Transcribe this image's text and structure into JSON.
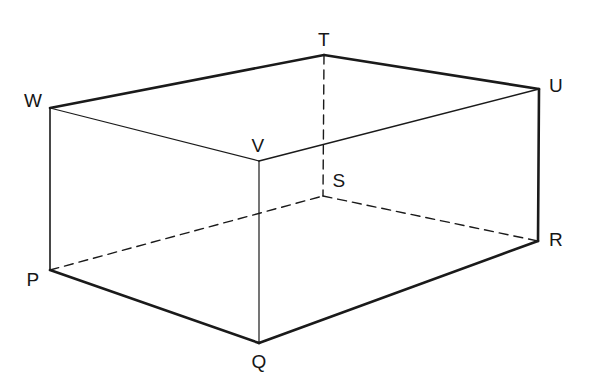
{
  "figure": {
    "type": "3d-cuboid-line-diagram",
    "background_color": "#ffffff",
    "line_color": "#1a1a1a",
    "canvas": {
      "width": 592,
      "height": 378
    }
  },
  "vertices": [
    {
      "id": "P",
      "label": "P",
      "x": 50,
      "y": 270,
      "label_x": 33,
      "label_y": 279,
      "hidden": false
    },
    {
      "id": "Q",
      "label": "Q",
      "x": 259,
      "y": 343,
      "label_x": 259,
      "label_y": 361,
      "hidden": false
    },
    {
      "id": "R",
      "label": "R",
      "x": 538,
      "y": 241,
      "label_x": 556,
      "label_y": 239,
      "hidden": false
    },
    {
      "id": "S",
      "label": "S",
      "x": 323,
      "y": 196,
      "label_x": 339,
      "label_y": 180,
      "hidden": true
    },
    {
      "id": "T",
      "label": "T",
      "x": 324,
      "y": 55,
      "label_x": 324,
      "label_y": 39,
      "hidden": false
    },
    {
      "id": "U",
      "label": "U",
      "x": 539,
      "y": 89,
      "label_x": 556,
      "label_y": 85,
      "hidden": false
    },
    {
      "id": "V",
      "label": "V",
      "x": 259,
      "y": 161,
      "label_x": 258,
      "label_y": 145,
      "hidden": false
    },
    {
      "id": "W",
      "label": "W",
      "x": 50,
      "y": 108,
      "label_x": 33,
      "label_y": 100,
      "hidden": false
    }
  ],
  "edges": [
    {
      "name": "edge-W-T",
      "from": "W",
      "to": "T",
      "style": "solid",
      "weight": 2.6
    },
    {
      "name": "edge-T-U",
      "from": "T",
      "to": "U",
      "style": "solid",
      "weight": 2.6
    },
    {
      "name": "edge-W-V",
      "from": "W",
      "to": "V",
      "style": "solid",
      "weight": 1.2
    },
    {
      "name": "edge-V-U",
      "from": "V",
      "to": "U",
      "style": "solid",
      "weight": 1.6
    },
    {
      "name": "edge-W-P",
      "from": "W",
      "to": "P",
      "style": "solid",
      "weight": 1.6
    },
    {
      "name": "edge-U-R",
      "from": "U",
      "to": "R",
      "style": "solid",
      "weight": 2.6
    },
    {
      "name": "edge-V-Q",
      "from": "V",
      "to": "Q",
      "style": "solid",
      "weight": 1.2
    },
    {
      "name": "edge-P-Q",
      "from": "P",
      "to": "Q",
      "style": "solid",
      "weight": 2.6
    },
    {
      "name": "edge-Q-R",
      "from": "Q",
      "to": "R",
      "style": "solid",
      "weight": 2.6
    },
    {
      "name": "edge-T-S",
      "from": "T",
      "to": "S",
      "style": "dashed",
      "weight": 1.4
    },
    {
      "name": "edge-P-S",
      "from": "P",
      "to": "S",
      "style": "dashed",
      "weight": 1.4
    },
    {
      "name": "edge-S-R",
      "from": "S",
      "to": "R",
      "style": "dashed",
      "weight": 1.4
    }
  ],
  "dash_pattern": "9,6"
}
